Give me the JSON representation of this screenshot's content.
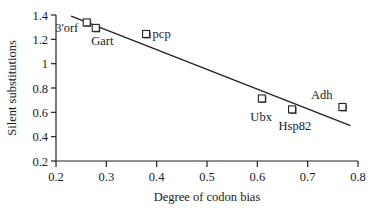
{
  "chart_data": {
    "type": "scatter",
    "title": "",
    "xlabel": "Degree of codon bias",
    "ylabel": "Silent substitutions",
    "xlim": [
      0.2,
      0.8
    ],
    "ylim": [
      0.2,
      1.4
    ],
    "x_ticks": [
      "0.2",
      "0.3",
      "0.4",
      "0.5",
      "0.6",
      "0.7",
      "0.8"
    ],
    "y_ticks": [
      "0.2",
      "0.4",
      "0.6",
      "0.8",
      "1",
      "1.2",
      "1.4"
    ],
    "grid": false,
    "legend": null,
    "points": [
      {
        "label": "3'orf",
        "x": 0.262,
        "y": 1.335
      },
      {
        "label": "Gart",
        "x": 0.28,
        "y": 1.29
      },
      {
        "label": "pcp",
        "x": 0.38,
        "y": 1.24
      },
      {
        "label": "Ubx",
        "x": 0.61,
        "y": 0.71
      },
      {
        "label": "Hsp82",
        "x": 0.67,
        "y": 0.62
      },
      {
        "label": "Adh",
        "x": 0.77,
        "y": 0.64
      }
    ],
    "trendline": {
      "type": "linear",
      "x": [
        0.23,
        0.785
      ],
      "y": [
        1.39,
        0.49
      ]
    },
    "marker": "open-square"
  }
}
